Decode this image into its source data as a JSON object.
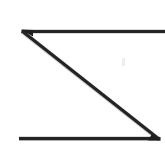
{
  "image": {
    "title": "Z",
    "description": "Hand-drawn capital letter Z",
    "background_color": "#ffffff",
    "stroke_color": "#242424",
    "stroke_color_light": "#9a9a9a",
    "width": 165,
    "height": 150,
    "alt_text": "A large hand-drawn capital letter Z formed by a top horizontal stroke, a descending diagonal stroke, and a bottom horizontal stroke."
  },
  "glyph": {
    "character": "Z",
    "style": "handwritten-scan",
    "strokes": [
      {
        "name": "top-horizontal-stroke",
        "type": "line",
        "x1": 22,
        "y1": 31.5,
        "x2": 165,
        "y2": 31.5,
        "width": 3.2
      },
      {
        "name": "diagonal-stroke",
        "type": "line",
        "x1": 22,
        "y1": 31.5,
        "x2": 159,
        "y2": 139.5,
        "width": 3.2
      },
      {
        "name": "bottom-horizontal-stroke",
        "type": "line",
        "x1": 19,
        "y1": 138.5,
        "x2": 160,
        "y2": 138.5,
        "width": 3.4
      }
    ]
  },
  "artifacts": [
    {
      "name": "scan-speck",
      "x": 123,
      "y": 62,
      "width": 3,
      "height": 7,
      "color": "#f0eeec"
    }
  ]
}
